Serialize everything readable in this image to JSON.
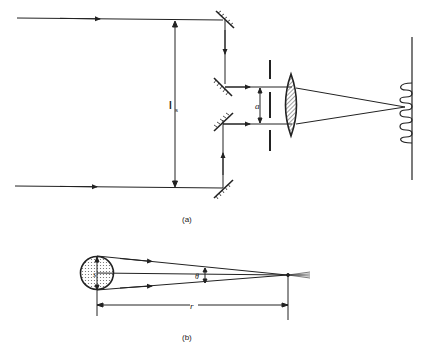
{
  "figure_a": {
    "caption": "(a)",
    "separation_label": "l",
    "separation_subscript": "s",
    "aperture_label": "a"
  },
  "figure_b": {
    "caption": "(b)",
    "source_label": "s",
    "angle_label": "θ",
    "distance_label": "r"
  },
  "colors": {
    "ink": "#222222",
    "hatch_fill": "#bbbbbb"
  }
}
